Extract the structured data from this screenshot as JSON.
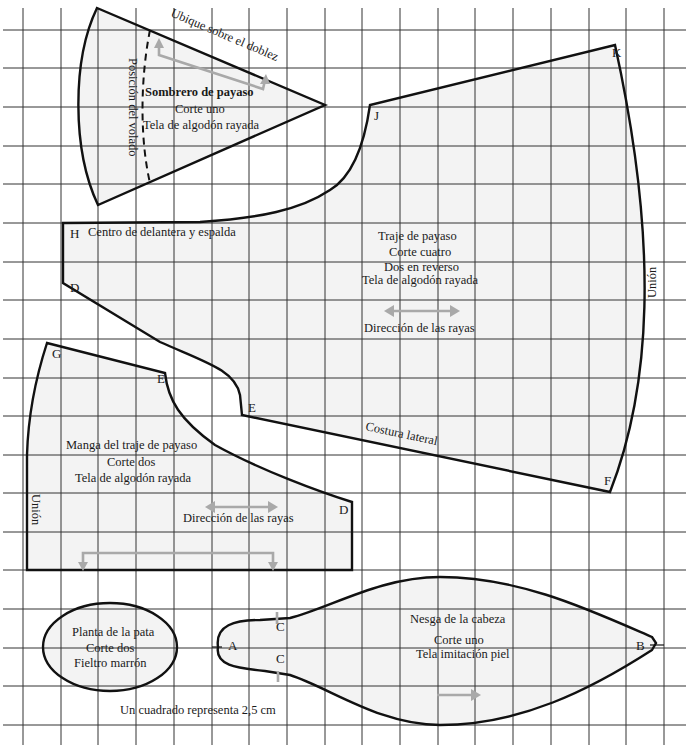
{
  "diagram": {
    "scale_note": "Un cuadrado representa 2,5 cm",
    "colors": {
      "piece_fill": "#f3f3f3",
      "outline": "#111111",
      "grid": "#333333",
      "grain_arrow": "#a9a9a9"
    },
    "grid": {
      "cell_width_px": 37.7,
      "cell_height_px": 38.6,
      "represents": "2,5 cm"
    },
    "pieces": {
      "hat": {
        "name": "Sombrero de payaso",
        "cut": "Corte uno",
        "fabric": "Tela de algodón rayada",
        "fold_note": "Ubique sobre el doblez",
        "ruffle_note": "Posición del volado"
      },
      "suit": {
        "name": "Traje de payaso",
        "cut": "Corte cuatro",
        "reverse": "Dos en reverso",
        "fabric": "Tela de algodón rayada",
        "grain": "Dirección de las rayas",
        "center_note": "Centro de delantera y espalda",
        "side_seam": "Costura lateral",
        "join": "Unión",
        "points": {
          "H": "H",
          "D": "D",
          "J": "J",
          "K": "K",
          "E": "E",
          "F": "F"
        }
      },
      "sleeve": {
        "name": "Manga del traje de payaso",
        "cut": "Corte dos",
        "fabric": "Tela de algodón rayada",
        "grain": "Dirección de las rayas",
        "join": "Unión",
        "points": {
          "G": "G",
          "E": "E",
          "D": "D"
        }
      },
      "paw": {
        "name": "Planta de la pata",
        "cut": "Corte dos",
        "fabric": "Fieltro marrón"
      },
      "head_gusset": {
        "name": "Nesga de la cabeza",
        "cut": "Corte uno",
        "fabric": "Tela imitación piel",
        "points": {
          "A": "A",
          "B": "B",
          "C1": "C",
          "C2": "C"
        }
      }
    }
  }
}
